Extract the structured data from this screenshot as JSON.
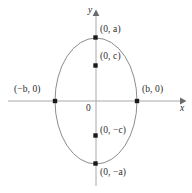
{
  "figure": {
    "type": "ellipse-diagram",
    "background_color": "#ffffff",
    "curve_color": "#8c8c8c",
    "axis_color": "#a8a8a8",
    "point_color": "#1a1a1a",
    "text_color": "#2b2b2b"
  },
  "axes": {
    "x_label": "x",
    "y_label": "y",
    "origin_label": "0"
  },
  "labels": {
    "top_vertex": "(0, a)",
    "bottom_vertex": "(0, −a)",
    "left_vertex": "(−b, 0)",
    "right_vertex": "(b, 0)",
    "upper_focus": "(0, c)",
    "lower_focus": "(0, −c)"
  },
  "geometry": {
    "center": {
      "x": 96,
      "y": 101
    },
    "semi_major_axis_px": 63,
    "semi_minor_axis_px": 41,
    "focus_offset_px": 35,
    "points": [
      {
        "name": "top-vertex",
        "x": 96,
        "y": 38,
        "label": "(0, a)"
      },
      {
        "name": "upper-focus",
        "x": 96,
        "y": 66,
        "label": "(0, c)"
      },
      {
        "name": "lower-focus",
        "x": 96,
        "y": 136,
        "label": "(0, −c)"
      },
      {
        "name": "bottom-vertex",
        "x": 96,
        "y": 164,
        "label": "(0, −a)"
      },
      {
        "name": "left-vertex",
        "x": 55,
        "y": 101,
        "label": "(−b, 0)"
      },
      {
        "name": "right-vertex",
        "x": 137,
        "y": 101,
        "label": "(b, 0)"
      }
    ]
  }
}
